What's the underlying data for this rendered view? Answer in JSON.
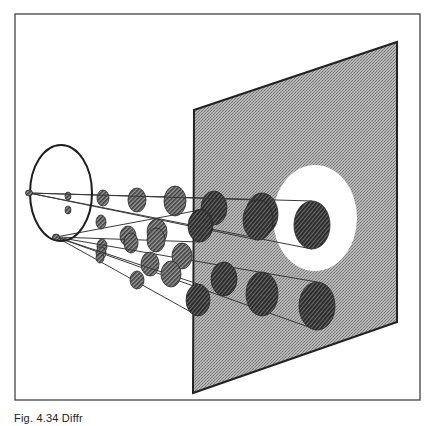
{
  "figure": {
    "caption": "Fig. 4.34 Diffr",
    "colors": {
      "frame": "#444444",
      "screen_fill": "#a8a8a8",
      "screen_edge": "#222222",
      "bright_spot": "#ffffff",
      "ring": "#1e1e1e",
      "ray": "#3a3a3a",
      "blob_fill": "#6a6a6a",
      "blob_dark": "#3c3c3c"
    },
    "frame": {
      "x": 15,
      "y": 14,
      "w": 405,
      "h": 386
    },
    "screen": {
      "points": [
        [
          194,
          110
        ],
        [
          397,
          42
        ],
        [
          397,
          322
        ],
        [
          193,
          393
        ]
      ]
    },
    "bright_spot": {
      "cx": 315,
      "cy": 218,
      "rx": 42,
      "ry": 53
    },
    "ring": {
      "cx": 61,
      "cy": 193,
      "rx": 31,
      "ry": 48
    },
    "sources": [
      {
        "label": "source-a",
        "x": 29,
        "y": 193
      },
      {
        "label": "source-b",
        "x": 56,
        "y": 237
      }
    ],
    "cones": [
      {
        "from": 0,
        "blobs": [
          [
            68,
            196,
            3,
            4
          ],
          [
            103,
            198,
            6,
            8
          ],
          [
            137,
            200,
            9,
            12
          ],
          [
            175,
            201,
            11,
            15
          ],
          [
            214,
            208,
            13,
            17
          ],
          [
            262,
            214,
            16,
            21
          ],
          [
            312,
            225,
            18,
            24
          ]
        ],
        "top": [
          [
            29,
            193
          ],
          [
            312,
            201
          ]
        ],
        "bottom": [
          [
            29,
            193
          ],
          [
            312,
            249
          ]
        ]
      },
      {
        "from": 0,
        "blobs": [
          [
            68,
            210,
            3,
            4
          ],
          [
            101,
            222,
            5,
            7
          ],
          [
            128,
            236,
            8,
            10
          ],
          [
            157,
            232,
            10,
            13
          ],
          [
            201,
            225,
            12,
            16
          ],
          [
            258,
            220,
            15,
            20
          ]
        ],
        "top": [
          [
            29,
            193
          ],
          [
            258,
            200
          ]
        ],
        "bottom": [
          [
            29,
            193
          ],
          [
            258,
            240
          ]
        ]
      },
      {
        "from": 1,
        "blobs": [
          [
            102,
            246,
            5,
            7
          ],
          [
            131,
            243,
            7,
            10
          ],
          [
            156,
            240,
            9,
            12
          ],
          [
            200,
            226,
            12,
            16
          ]
        ],
        "top": [
          [
            56,
            237
          ],
          [
            200,
            210
          ]
        ],
        "bottom": [
          [
            56,
            237
          ],
          [
            200,
            242
          ]
        ]
      },
      {
        "from": 1,
        "blobs": [
          [
            101,
            253,
            5,
            6
          ],
          [
            150,
            264,
            9,
            12
          ],
          [
            182,
            256,
            10,
            13
          ],
          [
            224,
            279,
            13,
            17
          ],
          [
            262,
            294,
            16,
            22
          ],
          [
            317,
            306,
            18,
            24
          ]
        ],
        "top": [
          [
            56,
            237
          ],
          [
            317,
            282
          ]
        ],
        "bottom": [
          [
            56,
            237
          ],
          [
            317,
            330
          ]
        ]
      },
      {
        "from": 1,
        "blobs": [
          [
            100,
            258,
            4,
            5
          ],
          [
            137,
            280,
            7,
            9
          ],
          [
            171,
            274,
            10,
            13
          ],
          [
            198,
            300,
            12,
            16
          ]
        ],
        "top": [
          [
            56,
            237
          ],
          [
            198,
            284
          ]
        ],
        "bottom": [
          [
            56,
            237
          ],
          [
            198,
            316
          ]
        ]
      }
    ]
  }
}
